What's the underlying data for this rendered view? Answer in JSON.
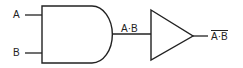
{
  "diagram": {
    "inputs": [
      {
        "label": "A"
      },
      {
        "label": "B"
      }
    ],
    "gates": [
      {
        "type": "AND",
        "output_label": "A·B"
      },
      {
        "type": "NOT",
        "output_label": "A·B",
        "output_overline": true
      }
    ],
    "colors": {
      "stroke": "#222222",
      "background": "#ffffff"
    }
  }
}
